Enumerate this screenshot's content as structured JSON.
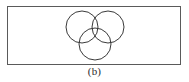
{
  "figure": {
    "label": "(b)",
    "caption_position": "below",
    "background_color": "#ffffff",
    "border_color": "#5a5a5a",
    "stroke_color": "#3a3a3a"
  },
  "chart_data": {
    "type": "diagram",
    "diagram_type": "venn",
    "title": "(b)",
    "subtitle": "",
    "xlabel": "",
    "ylabel": "",
    "grid": false,
    "legend": false,
    "set_count": 3,
    "shaded_regions": [],
    "region_labels": [],
    "frame": {
      "name": "universal-set-rectangle",
      "x": 7,
      "y": 6,
      "width": 174,
      "height": 59,
      "stroke": "#5a5a5a",
      "stroke_width": 1,
      "fill": "none"
    },
    "circles": [
      {
        "name": "set-a-circle",
        "label": "",
        "cx": 82,
        "cy": 27,
        "r": 16,
        "stroke": "#3a3a3a",
        "stroke_width": 1,
        "fill": "none"
      },
      {
        "name": "set-b-circle",
        "label": "",
        "cx": 108,
        "cy": 27,
        "r": 16,
        "stroke": "#3a3a3a",
        "stroke_width": 1,
        "fill": "none"
      },
      {
        "name": "set-c-circle",
        "label": "",
        "cx": 95,
        "cy": 44,
        "r": 16,
        "stroke": "#3a3a3a",
        "stroke_width": 1,
        "fill": "none"
      }
    ],
    "canvas": {
      "width": 189,
      "height": 82
    }
  }
}
